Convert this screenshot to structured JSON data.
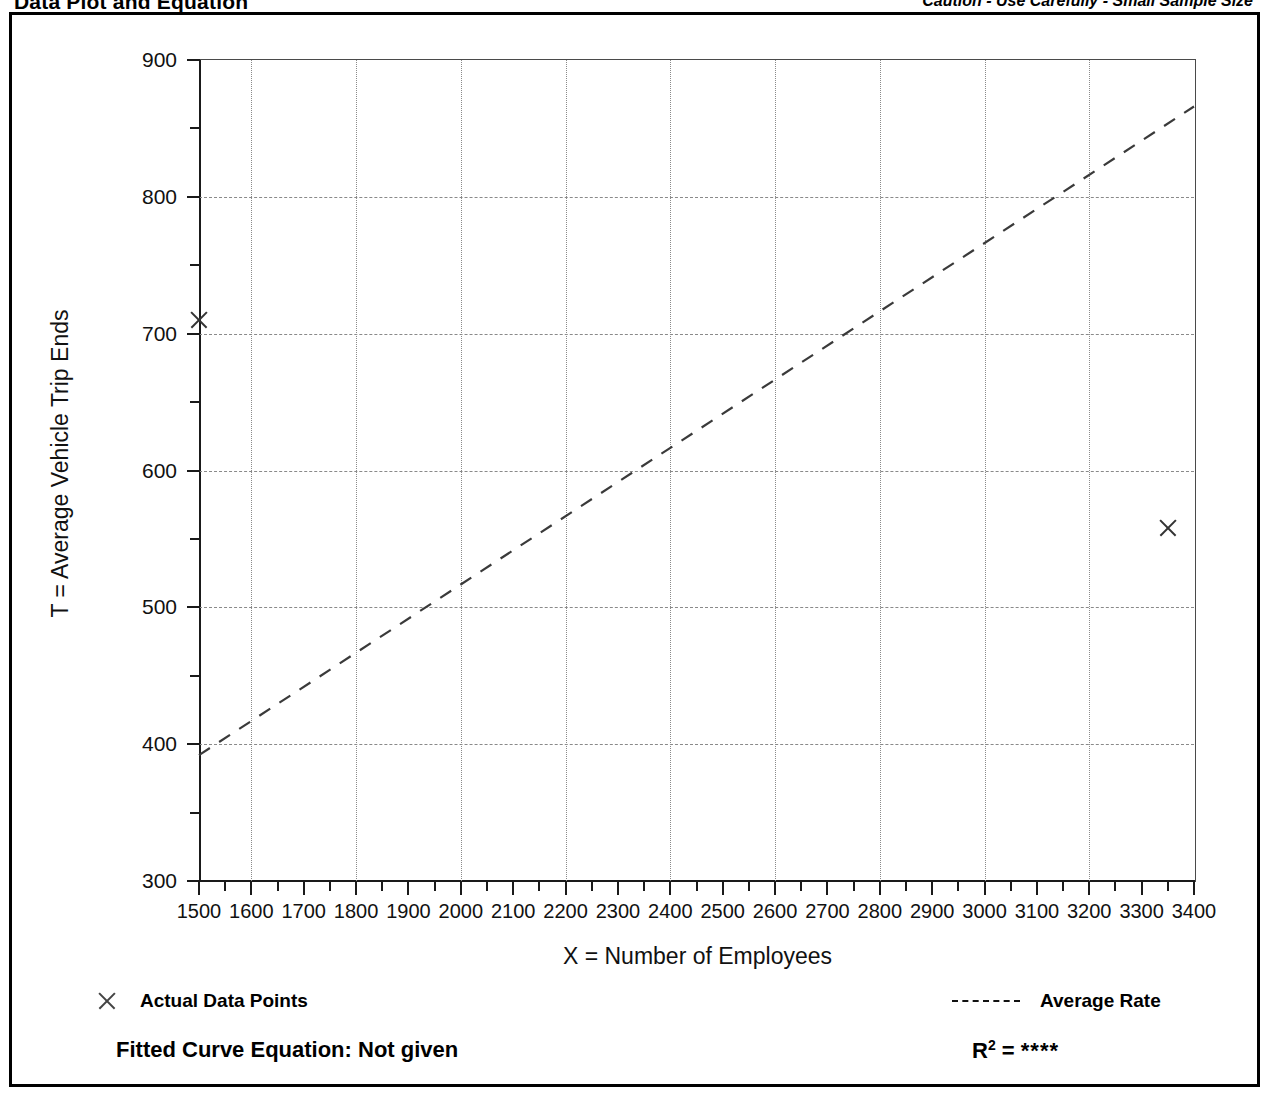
{
  "header": {
    "title": "Data Plot and Equation",
    "caution": "Caution - Use Carefully - Small Sample Size"
  },
  "legend": {
    "data_points_label": "Actual Data Points",
    "average_rate_label": "Average Rate",
    "data_points_icon": "x-marker-icon",
    "average_rate_icon": "dashed-line-icon"
  },
  "footer": {
    "equation_label": "Fitted Curve Equation:  Not given",
    "r2_label": "R",
    "r2_exponent": "2",
    "r2_equals": " = ",
    "r2_value": "****"
  },
  "chart_data": {
    "type": "scatter",
    "title": "Data Plot and Equation",
    "xlabel": "X = Number of Employees",
    "ylabel": "T = Average Vehicle Trip Ends",
    "xlim": [
      1500,
      3400
    ],
    "ylim": [
      300,
      900
    ],
    "xticks": [
      1500,
      1600,
      1700,
      1800,
      1900,
      2000,
      2100,
      2200,
      2300,
      2400,
      2500,
      2600,
      2700,
      2800,
      2900,
      3000,
      3100,
      3200,
      3300,
      3400
    ],
    "yticks": [
      300,
      400,
      500,
      600,
      700,
      800,
      900
    ],
    "y_minor_ticks": [
      350,
      450,
      550,
      650,
      750,
      850
    ],
    "x_minor_tick_step": 50,
    "grid": true,
    "grid_x_values": [
      1600,
      1800,
      2000,
      2200,
      2400,
      2600,
      2800,
      3000,
      3200,
      3400
    ],
    "grid_y_values": [
      400,
      500,
      600,
      700,
      800
    ],
    "legend_position": "below-plot",
    "series": [
      {
        "name": "Actual Data Points",
        "type": "scatter",
        "marker": "x",
        "points": [
          {
            "x": 1500,
            "y": 710
          },
          {
            "x": 3350,
            "y": 558
          }
        ]
      },
      {
        "name": "Average Rate",
        "type": "line",
        "style": "dashed",
        "points": [
          {
            "x": 1500,
            "y": 392
          },
          {
            "x": 3400,
            "y": 866
          }
        ]
      }
    ]
  }
}
